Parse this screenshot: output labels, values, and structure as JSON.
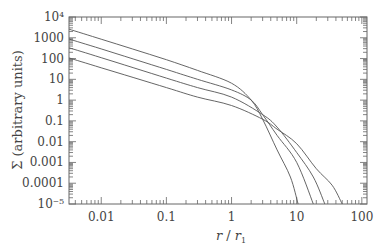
{
  "chart_data": {
    "type": "line",
    "title": "",
    "xlabel": "r / r1",
    "ylabel": "Σ (arbitrary units)",
    "xscale": "log",
    "yscale": "log",
    "xlim": [
      0.0032,
      120
    ],
    "ylim": [
      1e-05,
      10000
    ],
    "grid": false,
    "legend": null,
    "x_ticks": [
      {
        "value": 0.01,
        "label": "0.01"
      },
      {
        "value": 0.1,
        "label": "0.1"
      },
      {
        "value": 1,
        "label": "1"
      },
      {
        "value": 10,
        "label": "10"
      },
      {
        "value": 100,
        "label": "100"
      }
    ],
    "y_ticks": [
      {
        "value": 10000,
        "label": "10⁴"
      },
      {
        "value": 1000,
        "label": "1000"
      },
      {
        "value": 100,
        "label": "100"
      },
      {
        "value": 10,
        "label": "10"
      },
      {
        "value": 1,
        "label": "1"
      },
      {
        "value": 0.1,
        "label": "0.1"
      },
      {
        "value": 0.01,
        "label": "0.01"
      },
      {
        "value": 0.001,
        "label": "0.001"
      },
      {
        "value": 0.0001,
        "label": "0.0001"
      },
      {
        "value": 1e-05,
        "label": "10⁻⁵"
      }
    ],
    "series": [
      {
        "name": "curve 1",
        "x": [
          0.0032,
          0.01,
          0.03,
          0.1,
          0.3,
          1,
          2,
          3,
          5,
          8,
          10.5
        ],
        "y": [
          2600,
          850,
          290,
          88,
          27,
          6.5,
          1.0,
          0.12,
          0.004,
          0.0002,
          1e-05
        ]
      },
      {
        "name": "curve 2",
        "x": [
          0.0032,
          0.01,
          0.1,
          0.3,
          1,
          2,
          3,
          5,
          10,
          18
        ],
        "y": [
          870,
          290,
          30,
          10,
          3.1,
          1.0,
          0.2,
          0.02,
          0.001,
          1e-05
        ]
      },
      {
        "name": "curve 3",
        "x": [
          0.0032,
          0.01,
          0.1,
          0.3,
          1,
          3,
          5,
          10,
          18,
          27
        ],
        "y": [
          330,
          110,
          11.5,
          4,
          1.4,
          0.2,
          0.05,
          0.003,
          0.0002,
          1e-05
        ]
      },
      {
        "name": "curve 4",
        "x": [
          0.0032,
          0.01,
          0.1,
          0.3,
          1,
          3,
          5,
          10,
          20,
          35,
          50
        ],
        "y": [
          107,
          36,
          4,
          1.4,
          0.55,
          0.12,
          0.04,
          0.008,
          0.0005,
          8e-05,
          1e-05
        ]
      }
    ]
  },
  "labels": {
    "ylabel": "Σ (arbitrary units)",
    "xlabel_main": "r",
    "xlabel_sep": " / ",
    "xlabel_sub_base": "r",
    "xlabel_sub": "1"
  }
}
